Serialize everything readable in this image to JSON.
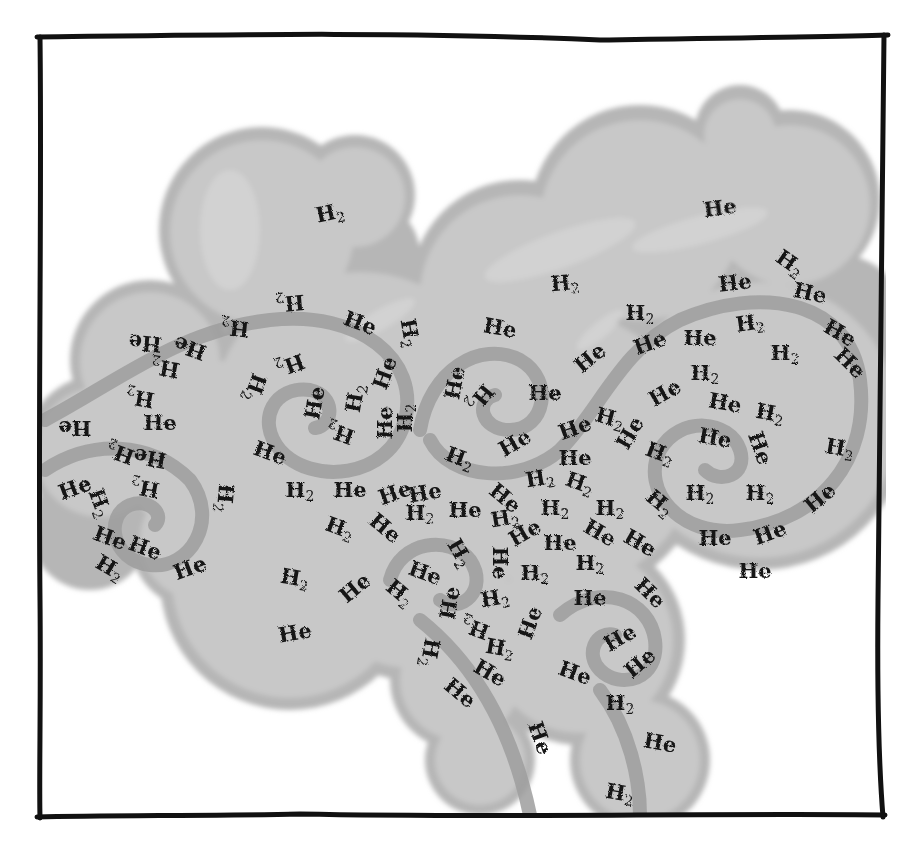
{
  "illustration": {
    "subject": "molecular gas cloud with swirling turbulence",
    "colors": {
      "background": "#ffffff",
      "frame": "#111111",
      "cloud_fill": "#c4c4c4",
      "cloud_edge": "#b2b2b2",
      "cloud_highlight": "#dddddd",
      "spiral_stroke": "#9c9c9c",
      "label_text": "#141414"
    },
    "legend_terms": [
      "H2",
      "He"
    ],
    "labels": [
      {
        "t": "H2",
        "x": 330,
        "y": 220,
        "r": -12
      },
      {
        "t": "He",
        "x": 720,
        "y": 215,
        "r": -8
      },
      {
        "t": "H2",
        "x": 565,
        "y": 290,
        "r": -5
      },
      {
        "t": "He",
        "x": 735,
        "y": 290,
        "r": -6
      },
      {
        "t": "H2",
        "x": 790,
        "y": 270,
        "r": 35
      },
      {
        "t": "He",
        "x": 810,
        "y": 300,
        "r": 12
      },
      {
        "t": "H2",
        "x": 290,
        "y": 310,
        "r": 175
      },
      {
        "t": "He",
        "x": 360,
        "y": 330,
        "r": 20
      },
      {
        "t": "H2",
        "x": 410,
        "y": 340,
        "r": 80
      },
      {
        "t": "He",
        "x": 145,
        "y": 350,
        "r": 185
      },
      {
        "t": "He",
        "x": 190,
        "y": 355,
        "r": 200
      },
      {
        "t": "H2",
        "x": 235,
        "y": 335,
        "r": 185
      },
      {
        "t": "H2",
        "x": 165,
        "y": 375,
        "r": 190
      },
      {
        "t": "He",
        "x": 500,
        "y": 335,
        "r": 10
      },
      {
        "t": "H2",
        "x": 640,
        "y": 320,
        "r": 0
      },
      {
        "t": "He",
        "x": 650,
        "y": 350,
        "r": -20
      },
      {
        "t": "He",
        "x": 700,
        "y": 345,
        "r": 0
      },
      {
        "t": "H2",
        "x": 750,
        "y": 330,
        "r": -8
      },
      {
        "t": "H2",
        "x": 785,
        "y": 360,
        "r": 0
      },
      {
        "t": "He",
        "x": 840,
        "y": 340,
        "r": 30
      },
      {
        "t": "He",
        "x": 850,
        "y": 370,
        "r": 45
      },
      {
        "t": "He",
        "x": 590,
        "y": 365,
        "r": -40
      },
      {
        "t": "He",
        "x": 665,
        "y": 400,
        "r": -30
      },
      {
        "t": "H2",
        "x": 705,
        "y": 380,
        "r": 0
      },
      {
        "t": "He",
        "x": 545,
        "y": 400,
        "r": 0
      },
      {
        "t": "He",
        "x": 455,
        "y": 390,
        "r": -80
      },
      {
        "t": "H2",
        "x": 480,
        "y": 405,
        "r": 130
      },
      {
        "t": "H2",
        "x": 140,
        "y": 405,
        "r": 190
      },
      {
        "t": "He",
        "x": 75,
        "y": 435,
        "r": 180
      },
      {
        "t": "He",
        "x": 160,
        "y": 430,
        "r": 0
      },
      {
        "t": "H2",
        "x": 255,
        "y": 395,
        "r": 110
      },
      {
        "t": "H2",
        "x": 290,
        "y": 372,
        "r": 160
      },
      {
        "t": "He",
        "x": 315,
        "y": 410,
        "r": -80
      },
      {
        "t": "H2",
        "x": 355,
        "y": 405,
        "r": -80
      },
      {
        "t": "He",
        "x": 385,
        "y": 380,
        "r": -70
      },
      {
        "t": "He",
        "x": 385,
        "y": 430,
        "r": -90
      },
      {
        "t": "H2",
        "x": 405,
        "y": 425,
        "r": -90
      },
      {
        "t": "H2",
        "x": 340,
        "y": 440,
        "r": -160
      },
      {
        "t": "He",
        "x": 270,
        "y": 460,
        "r": 20
      },
      {
        "t": "He",
        "x": 725,
        "y": 410,
        "r": 10
      },
      {
        "t": "H2",
        "x": 770,
        "y": 420,
        "r": 10
      },
      {
        "t": "He",
        "x": 715,
        "y": 445,
        "r": 10
      },
      {
        "t": "He",
        "x": 760,
        "y": 455,
        "r": 70
      },
      {
        "t": "H2",
        "x": 660,
        "y": 460,
        "r": 20
      },
      {
        "t": "H2",
        "x": 840,
        "y": 455,
        "r": 10
      },
      {
        "t": "He",
        "x": 515,
        "y": 450,
        "r": -30
      },
      {
        "t": "H2",
        "x": 460,
        "y": 465,
        "r": 20
      },
      {
        "t": "He",
        "x": 575,
        "y": 435,
        "r": -20
      },
      {
        "t": "H2",
        "x": 610,
        "y": 425,
        "r": 15
      },
      {
        "t": "He",
        "x": 630,
        "y": 440,
        "r": -60
      },
      {
        "t": "He",
        "x": 575,
        "y": 465,
        "r": 0
      },
      {
        "t": "He",
        "x": 150,
        "y": 465,
        "r": 190
      },
      {
        "t": "H2",
        "x": 120,
        "y": 460,
        "r": 200
      },
      {
        "t": "He",
        "x": 75,
        "y": 495,
        "r": -20
      },
      {
        "t": "H2",
        "x": 145,
        "y": 495,
        "r": 190
      },
      {
        "t": "H2",
        "x": 100,
        "y": 510,
        "r": 70
      },
      {
        "t": "H2",
        "x": 225,
        "y": 505,
        "r": 95
      },
      {
        "t": "H2",
        "x": 300,
        "y": 497,
        "r": 0
      },
      {
        "t": "He",
        "x": 350,
        "y": 497,
        "r": 0
      },
      {
        "t": "He",
        "x": 395,
        "y": 500,
        "r": -20
      },
      {
        "t": "He",
        "x": 425,
        "y": 500,
        "r": -10
      },
      {
        "t": "H2",
        "x": 420,
        "y": 520,
        "r": 0
      },
      {
        "t": "He",
        "x": 465,
        "y": 517,
        "r": 0
      },
      {
        "t": "He",
        "x": 505,
        "y": 505,
        "r": 40
      },
      {
        "t": "H2",
        "x": 540,
        "y": 485,
        "r": -10
      },
      {
        "t": "H2",
        "x": 580,
        "y": 490,
        "r": 20
      },
      {
        "t": "H2",
        "x": 505,
        "y": 525,
        "r": -10
      },
      {
        "t": "H2",
        "x": 555,
        "y": 515,
        "r": 0
      },
      {
        "t": "H2",
        "x": 610,
        "y": 515,
        "r": 0
      },
      {
        "t": "H2",
        "x": 660,
        "y": 510,
        "r": 40
      },
      {
        "t": "H2",
        "x": 700,
        "y": 500,
        "r": 0
      },
      {
        "t": "H2",
        "x": 760,
        "y": 500,
        "r": 0
      },
      {
        "t": "He",
        "x": 820,
        "y": 505,
        "r": -40
      },
      {
        "t": "H2",
        "x": 340,
        "y": 535,
        "r": 20
      },
      {
        "t": "He",
        "x": 385,
        "y": 535,
        "r": 40
      },
      {
        "t": "He",
        "x": 525,
        "y": 540,
        "r": -30
      },
      {
        "t": "He",
        "x": 560,
        "y": 550,
        "r": 0
      },
      {
        "t": "He",
        "x": 600,
        "y": 540,
        "r": 30
      },
      {
        "t": "He",
        "x": 640,
        "y": 550,
        "r": 30
      },
      {
        "t": "He",
        "x": 715,
        "y": 545,
        "r": 0
      },
      {
        "t": "He",
        "x": 770,
        "y": 540,
        "r": -20
      },
      {
        "t": "He",
        "x": 110,
        "y": 545,
        "r": 20
      },
      {
        "t": "He",
        "x": 145,
        "y": 555,
        "r": 20
      },
      {
        "t": "H2",
        "x": 110,
        "y": 575,
        "r": 30
      },
      {
        "t": "He",
        "x": 190,
        "y": 575,
        "r": -20
      },
      {
        "t": "H2",
        "x": 460,
        "y": 560,
        "r": 60
      },
      {
        "t": "He",
        "x": 500,
        "y": 570,
        "r": 90
      },
      {
        "t": "H2",
        "x": 535,
        "y": 580,
        "r": 0
      },
      {
        "t": "H2",
        "x": 590,
        "y": 570,
        "r": 0
      },
      {
        "t": "He",
        "x": 425,
        "y": 580,
        "r": 20
      },
      {
        "t": "He",
        "x": 650,
        "y": 600,
        "r": 45
      },
      {
        "t": "He",
        "x": 755,
        "y": 578,
        "r": 0
      },
      {
        "t": "H2",
        "x": 295,
        "y": 585,
        "r": 10
      },
      {
        "t": "He",
        "x": 355,
        "y": 595,
        "r": -40
      },
      {
        "t": "H2",
        "x": 400,
        "y": 600,
        "r": 40
      },
      {
        "t": "H2",
        "x": 495,
        "y": 605,
        "r": -10
      },
      {
        "t": "He",
        "x": 530,
        "y": 630,
        "r": -70
      },
      {
        "t": "He",
        "x": 590,
        "y": 605,
        "r": 0
      },
      {
        "t": "He",
        "x": 450,
        "y": 610,
        "r": -80
      },
      {
        "t": "H2",
        "x": 475,
        "y": 635,
        "r": 200
      },
      {
        "t": "He",
        "x": 620,
        "y": 645,
        "r": -30
      },
      {
        "t": "H2",
        "x": 500,
        "y": 655,
        "r": 10
      },
      {
        "t": "He",
        "x": 490,
        "y": 680,
        "r": 30
      },
      {
        "t": "He",
        "x": 295,
        "y": 640,
        "r": -10
      },
      {
        "t": "He",
        "x": 575,
        "y": 680,
        "r": 20
      },
      {
        "t": "He",
        "x": 640,
        "y": 670,
        "r": -40
      },
      {
        "t": "H2",
        "x": 620,
        "y": 710,
        "r": 0
      },
      {
        "t": "He",
        "x": 460,
        "y": 700,
        "r": 40
      },
      {
        "t": "H2",
        "x": 430,
        "y": 660,
        "r": 100
      },
      {
        "t": "He",
        "x": 540,
        "y": 745,
        "r": 70
      },
      {
        "t": "He",
        "x": 660,
        "y": 750,
        "r": 10
      },
      {
        "t": "H2",
        "x": 620,
        "y": 800,
        "r": 10
      }
    ]
  }
}
